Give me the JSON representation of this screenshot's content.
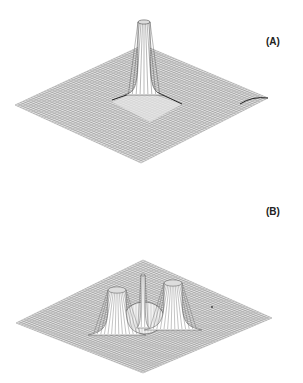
{
  "figure": {
    "panels": [
      {
        "id": "A",
        "label": "(A)",
        "description": "3D wireframe surface plot with a single tall central spike rising from a flat diamond-shaped mesh; subtle ridges along diagonals",
        "surface": {
          "corners": {
            "left": [
              15,
              105
            ],
            "back": [
              143,
              45
            ],
            "right": [
              268,
              98
            ],
            "front": [
              141,
              163
            ]
          },
          "peaks": [
            {
              "name": "central-spike",
              "x": 144,
              "base_y": 95,
              "top_y": 22,
              "half_width": 6
            }
          ]
        }
      },
      {
        "id": "B",
        "label": "(B)",
        "description": "3D wireframe surface plot with three peaks: a narrow central spike surrounded by a circular dome, flanked by two broader side peaks",
        "surface": {
          "corners": {
            "left": [
              16,
              323
            ],
            "back": [
              143,
              260
            ],
            "right": [
              272,
              318
            ],
            "front": [
              143,
              373
            ]
          },
          "peaks": [
            {
              "name": "left-peak",
              "x": 117,
              "base_y": 335,
              "top_y": 290,
              "half_width": 9
            },
            {
              "name": "central-spike",
              "x": 143,
              "base_y": 328,
              "top_y": 275,
              "half_width": 2
            },
            {
              "name": "right-peak",
              "x": 173,
              "base_y": 330,
              "top_y": 283,
              "half_width": 9
            }
          ],
          "dome": {
            "cx": 144,
            "cy": 318,
            "rx": 20,
            "ry": 16
          }
        }
      }
    ],
    "colors": {
      "mesh": "#8a8a8a",
      "mesh_dark": "#333333",
      "background": "#ffffff",
      "label": "#222222"
    }
  }
}
